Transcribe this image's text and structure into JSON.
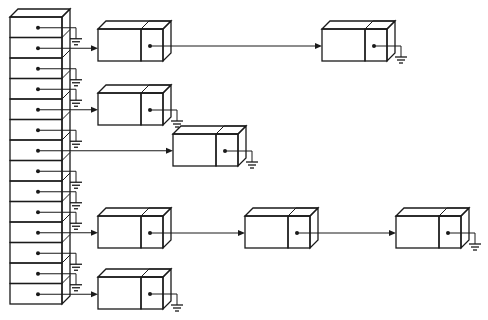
{
  "diagram": {
    "colors": {
      "slot_fill": "#d9d9d9",
      "slot_side": "#c4c4c4",
      "slot_top": "#e6e6e6",
      "node_data_fill": "#ffffff",
      "node_ptr_fill": "#d4d4d4",
      "node_side": "#c8c8c8",
      "line": "#1a1a1a"
    },
    "array": {
      "x": 10,
      "top": 17,
      "width": 52,
      "slot_height": 20.5,
      "depth": 8,
      "slots": [
        {
          "index": 0,
          "chain": null
        },
        {
          "index": 1,
          "chain": [
            {
              "x": 98,
              "y": 29
            },
            {
              "x": 322,
              "y": 29
            }
          ]
        },
        {
          "index": 2,
          "chain": null
        },
        {
          "index": 3,
          "chain": null
        },
        {
          "index": 4,
          "chain": [
            {
              "x": 98,
              "y": 93
            }
          ]
        },
        {
          "index": 5,
          "chain": null
        },
        {
          "index": 6,
          "chain": [
            {
              "x": 173,
              "y": 134
            }
          ]
        },
        {
          "index": 7,
          "chain": null
        },
        {
          "index": 8,
          "chain": null
        },
        {
          "index": 9,
          "chain": null
        },
        {
          "index": 10,
          "chain": [
            {
              "x": 98,
              "y": 216
            },
            {
              "x": 245,
              "y": 216
            },
            {
              "x": 396,
              "y": 216
            }
          ]
        },
        {
          "index": 11,
          "chain": null
        },
        {
          "index": 12,
          "chain": null
        },
        {
          "index": 13,
          "chain": [
            {
              "x": 98,
              "y": 277
            }
          ]
        }
      ]
    },
    "node": {
      "data_width": 43,
      "ptr_width": 22,
      "height": 32,
      "depth": 8
    },
    "icons": {
      "null_pointer": "ground-symbol-icon",
      "pointer_dot": "pointer-dot-icon",
      "arrow": "arrowhead-icon"
    }
  }
}
